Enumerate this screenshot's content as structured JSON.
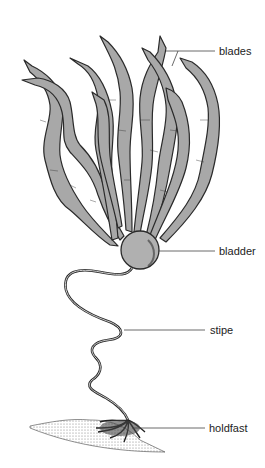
{
  "diagram": {
    "labels": [
      {
        "id": "blades",
        "text": "blades",
        "x": 219,
        "y": 46,
        "line": {
          "x1": 166,
          "y1": 51,
          "x2": 215,
          "y2": 51
        }
      },
      {
        "id": "bladder",
        "text": "bladder",
        "x": 219,
        "y": 251,
        "line": {
          "x1": 160,
          "y1": 256,
          "x2": 215,
          "y2": 256
        }
      },
      {
        "id": "stipe",
        "text": "stipe",
        "x": 210,
        "y": 327,
        "line": {
          "x1": 124,
          "y1": 332,
          "x2": 205,
          "y2": 332
        }
      },
      {
        "id": "holdfast",
        "text": "holdfast",
        "x": 209,
        "y": 424,
        "line": {
          "x1": 130,
          "y1": 429,
          "x2": 205,
          "y2": 429
        }
      }
    ],
    "colors": {
      "blade_fill": "#a8a8a8",
      "outline": "#2a2a2a",
      "label_text": "#222222",
      "leader_line": "#444444",
      "background": "#ffffff"
    }
  }
}
